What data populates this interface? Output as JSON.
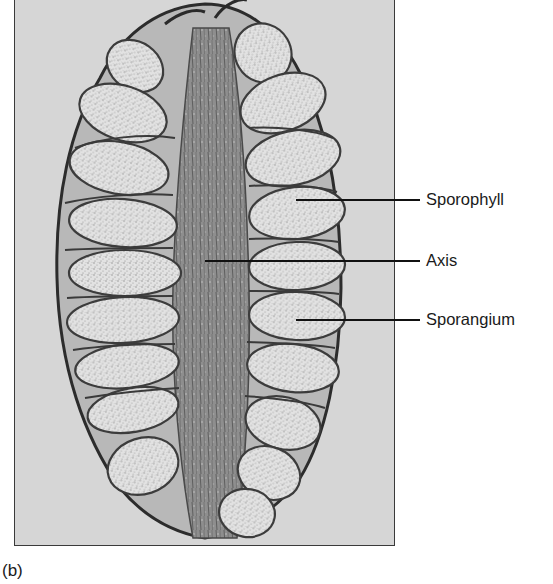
{
  "figure": {
    "panel_label": "(b)",
    "labels": [
      {
        "text": "Sporophyll",
        "target": "sporophyll"
      },
      {
        "text": "Axis",
        "target": "axis"
      },
      {
        "text": "Sporangium",
        "target": "sporangium"
      }
    ],
    "colors": {
      "background": "#d6d6d6",
      "frame_border": "#3a3a3a",
      "tissue_dark": "#3c3c3c",
      "sporangium_fill": "#e4e4e4",
      "leader_line": "#111111",
      "text": "#1a1a1a"
    }
  }
}
